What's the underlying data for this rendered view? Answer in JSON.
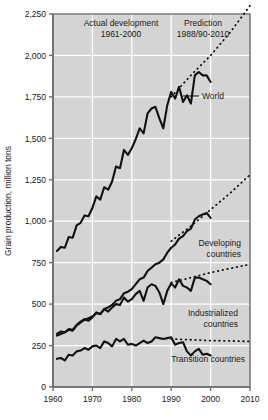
{
  "chart_data": {
    "type": "line",
    "title": "",
    "xlabel": "",
    "ylabel": "Grain production, million tons",
    "xlim": [
      1960,
      2010
    ],
    "ylim": [
      0,
      2250
    ],
    "grid": true,
    "legend_position": "inline-labels",
    "xticks": [
      "1960",
      "1970",
      "1980",
      "1990",
      "2000",
      "2010"
    ],
    "xtick_values": [
      1960,
      1970,
      1980,
      1990,
      2000,
      2010
    ],
    "yticks": [
      "0",
      "250",
      "500",
      "750",
      "1,000",
      "1,250",
      "1,500",
      "1,750",
      "2,000",
      "2,250"
    ],
    "ytick_values": [
      0,
      250,
      500,
      750,
      1000,
      1250,
      1500,
      1750,
      2000,
      2250
    ],
    "panels": [
      {
        "name": "actual",
        "title": "Actual development",
        "subtitle": "1961-2000"
      },
      {
        "name": "prediction",
        "title": "Prediction",
        "subtitle": "1988/90-2010"
      }
    ],
    "divider_year": 1990,
    "series": [
      {
        "name": "World",
        "label": "World",
        "style": "solid",
        "x": [
          1961,
          1962,
          1963,
          1964,
          1965,
          1966,
          1967,
          1968,
          1969,
          1970,
          1971,
          1972,
          1973,
          1974,
          1975,
          1976,
          1977,
          1978,
          1979,
          1980,
          1981,
          1982,
          1983,
          1984,
          1985,
          1986,
          1987,
          1988,
          1989,
          1990,
          1991,
          1992,
          1993,
          1994,
          1995,
          1996,
          1997,
          1998,
          1999,
          2000
        ],
        "values": [
          820,
          845,
          840,
          905,
          900,
          975,
          990,
          1035,
          1030,
          1080,
          1150,
          1130,
          1205,
          1190,
          1240,
          1330,
          1320,
          1430,
          1400,
          1440,
          1495,
          1560,
          1530,
          1650,
          1680,
          1690,
          1620,
          1560,
          1700,
          1780,
          1740,
          1810,
          1720,
          1760,
          1710,
          1880,
          1900,
          1880,
          1880,
          1840
        ]
      },
      {
        "name": "World prediction",
        "label": "",
        "style": "dotted",
        "x": [
          1990,
          1995,
          2000,
          2005,
          2010
        ],
        "values": [
          1750,
          1880,
          2000,
          2140,
          2300
        ]
      },
      {
        "name": "Developing countries",
        "label": "Developing countries",
        "style": "solid",
        "x": [
          1961,
          1962,
          1963,
          1964,
          1965,
          1966,
          1967,
          1968,
          1969,
          1970,
          1971,
          1972,
          1973,
          1974,
          1975,
          1976,
          1977,
          1978,
          1979,
          1980,
          1981,
          1982,
          1983,
          1984,
          1985,
          1986,
          1987,
          1988,
          1989,
          1990,
          1991,
          1992,
          1993,
          1994,
          1995,
          1996,
          1997,
          1998,
          1999,
          2000
        ],
        "values": [
          310,
          320,
          330,
          345,
          340,
          370,
          390,
          405,
          415,
          425,
          445,
          440,
          470,
          480,
          495,
          520,
          530,
          565,
          575,
          590,
          620,
          650,
          660,
          700,
          720,
          740,
          750,
          770,
          810,
          840,
          860,
          895,
          910,
          940,
          955,
          1010,
          1030,
          1040,
          1050,
          1020
        ]
      },
      {
        "name": "Developing countries prediction",
        "label": "",
        "style": "dotted",
        "x": [
          1990,
          1995,
          2000,
          2005,
          2010
        ],
        "values": [
          880,
          970,
          1070,
          1170,
          1280
        ]
      },
      {
        "name": "Industrialized countries",
        "label": "Industrialized countries",
        "style": "solid",
        "x": [
          1961,
          1962,
          1963,
          1964,
          1965,
          1966,
          1967,
          1968,
          1969,
          1970,
          1971,
          1972,
          1973,
          1974,
          1975,
          1976,
          1977,
          1978,
          1979,
          1980,
          1981,
          1982,
          1983,
          1984,
          1985,
          1986,
          1987,
          1988,
          1989,
          1990,
          1991,
          1992,
          1993,
          1994,
          1995,
          1996,
          1997,
          1998,
          1999,
          2000
        ],
        "values": [
          320,
          335,
          330,
          350,
          345,
          375,
          395,
          410,
          400,
          420,
          450,
          440,
          470,
          455,
          480,
          500,
          495,
          540,
          515,
          530,
          560,
          580,
          520,
          600,
          620,
          610,
          570,
          500,
          580,
          625,
          600,
          650,
          610,
          600,
          580,
          660,
          660,
          650,
          640,
          620
        ]
      },
      {
        "name": "Industrialized countries prediction",
        "label": "",
        "style": "dotted",
        "x": [
          1990,
          1995,
          2000,
          2005,
          2010
        ],
        "values": [
          630,
          660,
          690,
          715,
          740
        ]
      },
      {
        "name": "Transition countries",
        "label": "Transition countries",
        "style": "solid",
        "x": [
          1961,
          1962,
          1963,
          1964,
          1965,
          1966,
          1967,
          1968,
          1969,
          1970,
          1971,
          1972,
          1973,
          1974,
          1975,
          1976,
          1977,
          1978,
          1979,
          1980,
          1981,
          1982,
          1983,
          1984,
          1985,
          1986,
          1987,
          1988,
          1989,
          1990,
          1991,
          1992,
          1993,
          1994,
          1995,
          1996,
          1997,
          1998,
          1999,
          2000
        ],
        "values": [
          170,
          175,
          160,
          195,
          190,
          215,
          220,
          235,
          225,
          245,
          250,
          235,
          275,
          265,
          245,
          290,
          275,
          290,
          255,
          260,
          250,
          265,
          280,
          265,
          275,
          300,
          295,
          290,
          295,
          300,
          255,
          265,
          270,
          215,
          190,
          215,
          230,
          195,
          200,
          190
        ]
      },
      {
        "name": "Transition countries prediction",
        "label": "",
        "style": "dotted",
        "x": [
          1990,
          1995,
          2000,
          2005,
          2010
        ],
        "values": [
          290,
          285,
          280,
          278,
          275
        ]
      }
    ],
    "colors": {
      "plot_background": "#d4d4d4",
      "gridline": "#ffffff",
      "series_line": "#111111",
      "frame": "#6e6e6e",
      "text": "#1a1a1a",
      "page_background": "#ffffff"
    }
  }
}
